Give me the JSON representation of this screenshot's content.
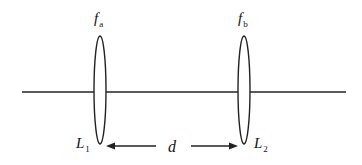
{
  "diagram": {
    "type": "two-lens optical system",
    "lenses": [
      {
        "id": "L1",
        "label": "L",
        "label_sub": "1",
        "focal_label": "f",
        "focal_sub": "a"
      },
      {
        "id": "L2",
        "label": "L",
        "label_sub": "2",
        "focal_label": "f",
        "focal_sub": "b"
      }
    ],
    "separation_label": "d",
    "colors": {
      "stroke": "#222222",
      "background": "#ffffff"
    }
  }
}
